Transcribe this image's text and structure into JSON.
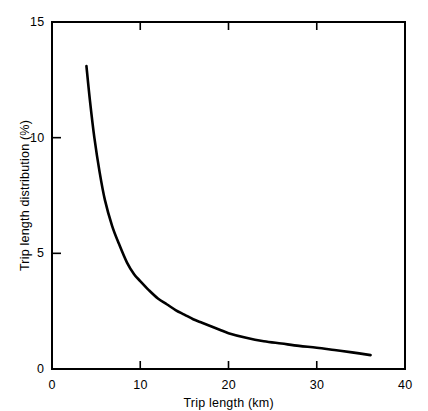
{
  "chart_data": {
    "type": "line",
    "title": "",
    "xlabel": "Trip length (km)",
    "ylabel": "Trip length distribution (%)",
    "xlim": [
      0,
      40
    ],
    "ylim": [
      0,
      15
    ],
    "xticks": [
      0,
      10,
      20,
      30,
      40
    ],
    "xtick_labels": [
      "0",
      "10",
      "20",
      "30",
      "40"
    ],
    "yticks": [
      0,
      5,
      10,
      15
    ],
    "ytick_labels": [
      "0",
      "5",
      "10",
      "15"
    ],
    "grid": false,
    "legend": "none",
    "series": [
      {
        "name": "Trip length distribution",
        "color": "#000000",
        "x": [
          3.9,
          4.3,
          4.8,
          5.4,
          6.0,
          6.8,
          7.6,
          8.5,
          9.3,
          10.0,
          11.0,
          12.0,
          13.0,
          14.0,
          15.0,
          16.0,
          17.0,
          18.0,
          19.0,
          20.0,
          22.0,
          24.0,
          26.0,
          28.0,
          30.0,
          32.0,
          34.0,
          36.1
        ],
        "y": [
          13.1,
          11.6,
          10.0,
          8.5,
          7.3,
          6.2,
          5.4,
          4.6,
          4.1,
          3.8,
          3.4,
          3.05,
          2.8,
          2.55,
          2.35,
          2.15,
          2.0,
          1.85,
          1.7,
          1.55,
          1.35,
          1.2,
          1.1,
          1.0,
          0.92,
          0.82,
          0.72,
          0.6
        ]
      }
    ]
  },
  "axes": {
    "x_title": "Trip length (km)",
    "y_title": "Trip length distribution (%)",
    "x_tick_labels": [
      "0",
      "10",
      "20",
      "30",
      "40"
    ],
    "y_tick_labels": [
      "0",
      "5",
      "10",
      "15"
    ]
  }
}
